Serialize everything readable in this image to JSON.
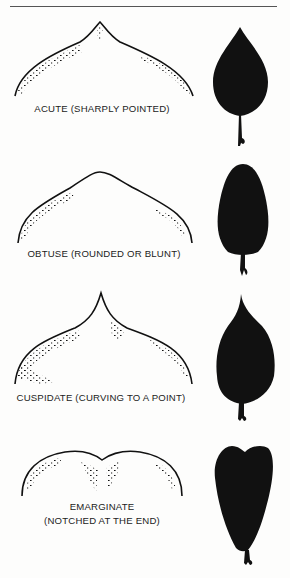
{
  "figure": {
    "rows": [
      {
        "term": "acute",
        "label": "ACUTE (SHARPLY POINTED)"
      },
      {
        "term": "obtuse",
        "label": "OBTUSE (ROUNDED OR BLUNT)"
      },
      {
        "term": "cuspidate",
        "label": "CUSPIDATE (CURVING TO A POINT)"
      },
      {
        "term": "emarginate",
        "label_line1": "EMARGINATE",
        "label_line2": "(NOTCHED AT THE END)"
      }
    ]
  },
  "colors": {
    "ink": "#111111",
    "paper": "#fdfdfc"
  }
}
